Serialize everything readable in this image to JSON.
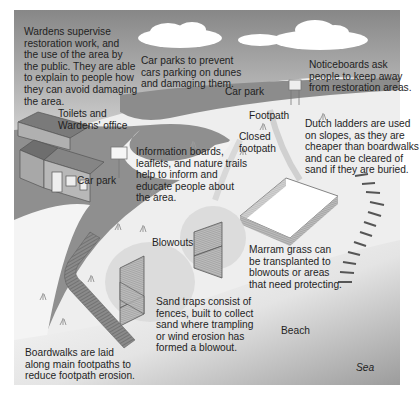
{
  "colors": {
    "sky_top": "#8a8a8a",
    "sky_bottom": "#d6d6d6",
    "road": "#8f8f8f",
    "dune": "#f2f2f2",
    "sea": "#a9a9a9",
    "text": "#1f1f1f"
  },
  "labels": {
    "wardens": [
      "Wardens supervise",
      "restoration work, and",
      "the use of the area by",
      "the public. They are able",
      "to explain to people how",
      "they can avoid damaging",
      "the area."
    ],
    "car_parks_note": [
      "Car parks to prevent",
      "cars parking on dunes",
      "and damaging them."
    ],
    "noticeboards": [
      "Noticeboards ask",
      "people to keep away",
      "from restoration areas."
    ],
    "car_park_top": "Car park",
    "toilets": [
      "Toilets and",
      "Wardens' office"
    ],
    "footpath": "Footpath",
    "closed_footpath": [
      "Closed",
      "footpath"
    ],
    "dutch_ladders": [
      "Dutch ladders are used",
      "on slopes, as they are",
      "cheaper than boardwalks",
      "and can be cleared of",
      "sand if they are buried."
    ],
    "information": [
      "Information boards,",
      "leaflets, and nature trails",
      "help to inform and",
      "educate people about",
      "the area."
    ],
    "car_park_left": "Car park",
    "blowouts": "Blowouts",
    "marram": [
      "Marram grass can",
      "be transplanted to",
      "blowouts or areas",
      "that need protecting."
    ],
    "sand_traps": [
      "Sand traps consist of",
      "fences, built to collect",
      "sand where trampling",
      "or wind erosion has",
      "formed a blowout."
    ],
    "beach": "Beach",
    "boardwalks": [
      "Boardwalks are laid",
      "along main footpaths to",
      "reduce footpath erosion."
    ],
    "sea": "Sea"
  }
}
